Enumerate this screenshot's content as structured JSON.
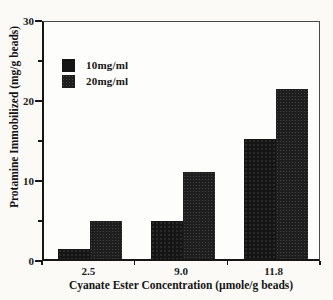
{
  "chart_data": {
    "type": "bar",
    "title": "",
    "categories": [
      "2.5",
      "9.0",
      "11.8"
    ],
    "series": [
      {
        "name": "10mg/ml",
        "values": [
          1.2,
          4.8,
          15.0
        ],
        "color": "#151515"
      },
      {
        "name": "20mg/ml",
        "values": [
          4.8,
          10.9,
          21.2
        ],
        "color": "#1e1e1e"
      }
    ],
    "xlabel": "Cyanate Ester Concentration (µmole/g beads)",
    "ylabel": "Protamine Immobilized (mg/g beads)",
    "ylim": [
      0,
      30
    ],
    "y_major_ticks": [
      0,
      10,
      20,
      30
    ],
    "y_minor_ticks": [
      5,
      15,
      25
    ],
    "legend_position": "upper-left",
    "grid": false,
    "bar_style": "solid dark halftone fill, grouped pairs, no gap within pair"
  }
}
